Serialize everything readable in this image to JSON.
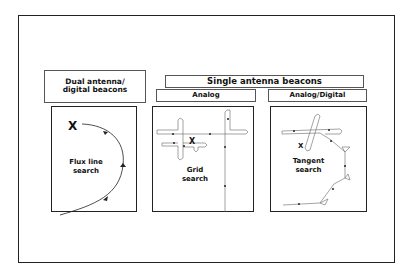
{
  "headers": {
    "dual": [
      "Dual antenna/",
      "digital beacons"
    ],
    "single": "Single antenna beacons",
    "analog": "Analog",
    "analog_digital": "Analog/Digital"
  },
  "panels": [
    {
      "id": "flux",
      "label_line1": "Flux line",
      "label_line2": "search",
      "marker": "X"
    },
    {
      "id": "grid",
      "label_line1": "Grid",
      "label_line2": "search",
      "marker": "X"
    },
    {
      "id": "tangent",
      "label_line1": "Tangent",
      "label_line2": "search",
      "marker": "X"
    }
  ]
}
